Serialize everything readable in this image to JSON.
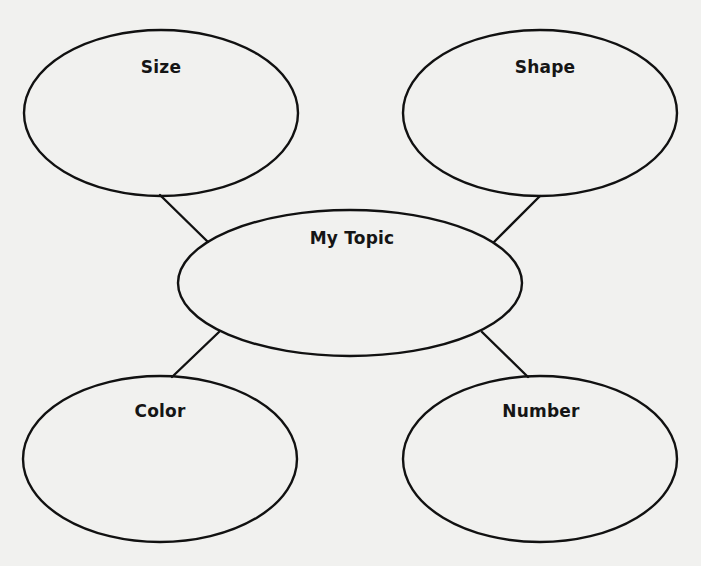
{
  "diagram": {
    "type": "concept-web",
    "background": "#f1f1ef",
    "stroke_color": "#111111",
    "center": {
      "id": "topic",
      "label": "My Topic",
      "cx": 350,
      "cy": 283,
      "rx": 172,
      "ry": 73,
      "label_x": 352,
      "label_y": 238
    },
    "nodes": [
      {
        "id": "size",
        "label": "Size",
        "cx": 161,
        "cy": 113,
        "rx": 137,
        "ry": 83,
        "label_x": 161,
        "label_y": 67
      },
      {
        "id": "shape",
        "label": "Shape",
        "cx": 540,
        "cy": 113,
        "rx": 137,
        "ry": 83,
        "label_x": 545,
        "label_y": 67
      },
      {
        "id": "color",
        "label": "Color",
        "cx": 160,
        "cy": 459,
        "rx": 137,
        "ry": 83,
        "label_x": 160,
        "label_y": 411
      },
      {
        "id": "number",
        "label": "Number",
        "cx": 540,
        "cy": 459,
        "rx": 137,
        "ry": 83,
        "label_x": 541,
        "label_y": 411
      }
    ],
    "edges": [
      {
        "from": "size",
        "to": "topic",
        "x1": 160,
        "y1": 195,
        "x2": 208,
        "y2": 242
      },
      {
        "from": "shape",
        "to": "topic",
        "x1": 540,
        "y1": 196,
        "x2": 494,
        "y2": 242
      },
      {
        "from": "color",
        "to": "topic",
        "x1": 172,
        "y1": 377,
        "x2": 219,
        "y2": 332
      },
      {
        "from": "number",
        "to": "topic",
        "x1": 528,
        "y1": 377,
        "x2": 482,
        "y2": 332
      }
    ]
  }
}
